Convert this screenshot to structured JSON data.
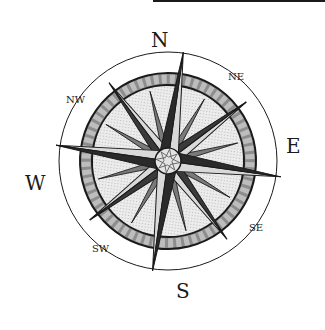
{
  "figure": {
    "top_rule": true,
    "colors": {
      "ink": "#1a1a1a",
      "dark_gray": "#555555",
      "mid_gray": "#9a9a9a",
      "light_gray": "#d6d6d6",
      "background": "#ffffff"
    },
    "cardinal_labels": {
      "n": "N",
      "e": "E",
      "s": "S",
      "w": "W"
    },
    "intercardinal_labels": {
      "ne": "NE",
      "se": "SE",
      "sw": "SW",
      "nw": "NW"
    }
  }
}
